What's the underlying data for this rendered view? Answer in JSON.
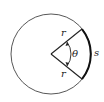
{
  "diagram": {
    "type": "circle-sector-arc-length",
    "labels": {
      "radius_upper": "r",
      "radius_lower": "r",
      "angle": "θ",
      "arc": "s"
    },
    "colors": {
      "stroke": "#333333",
      "arc": "#111111",
      "background": "#ffffff"
    }
  }
}
